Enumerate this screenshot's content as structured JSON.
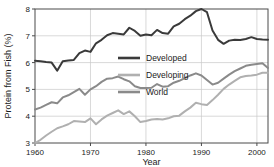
{
  "chart_data": {
    "type": "line",
    "title": "",
    "xlabel": "Year",
    "ylabel": "Protein from Fish (%)",
    "xlim": [
      1960,
      2002
    ],
    "ylim": [
      3,
      8
    ],
    "xticks": [
      1960,
      1970,
      1980,
      1990,
      2000
    ],
    "yticks": [
      3,
      4,
      5,
      6,
      7,
      8
    ],
    "grid": true,
    "legend_position": "center",
    "x": [
      1960,
      1961,
      1962,
      1963,
      1964,
      1965,
      1966,
      1967,
      1968,
      1969,
      1970,
      1971,
      1972,
      1973,
      1974,
      1975,
      1976,
      1977,
      1978,
      1979,
      1980,
      1981,
      1982,
      1983,
      1984,
      1985,
      1986,
      1987,
      1988,
      1989,
      1990,
      1991,
      1992,
      1993,
      1994,
      1995,
      1996,
      1997,
      1998,
      1999,
      2000,
      2001,
      2002
    ],
    "series": [
      {
        "name": "Developed",
        "color": "#3a3a3a",
        "values": [
          6.07,
          6.05,
          6.02,
          6.0,
          5.7,
          6.05,
          6.08,
          6.1,
          6.35,
          6.45,
          6.4,
          6.72,
          6.85,
          7.02,
          7.1,
          7.08,
          7.05,
          7.3,
          7.18,
          7.0,
          7.05,
          7.02,
          7.22,
          7.1,
          7.08,
          7.35,
          7.45,
          7.62,
          7.75,
          7.92,
          8.0,
          7.88,
          7.2,
          6.85,
          6.7,
          6.82,
          6.85,
          6.84,
          6.88,
          6.95,
          6.88,
          6.86,
          6.85
        ]
      },
      {
        "name": "Developing",
        "color": "#b0b0b0",
        "values": [
          3.0,
          3.12,
          3.28,
          3.42,
          3.55,
          3.62,
          3.7,
          3.82,
          3.8,
          3.78,
          3.92,
          3.7,
          3.88,
          4.02,
          4.12,
          4.22,
          4.08,
          4.18,
          4.0,
          3.78,
          3.82,
          3.88,
          3.9,
          3.88,
          3.92,
          4.0,
          4.02,
          4.18,
          4.32,
          4.5,
          4.45,
          4.42,
          4.6,
          4.8,
          5.02,
          5.18,
          5.32,
          5.45,
          5.5,
          5.52,
          5.55,
          5.62,
          5.62
        ]
      },
      {
        "name": "World",
        "color": "#8a8a8a",
        "values": [
          4.25,
          4.32,
          4.42,
          4.52,
          4.48,
          4.7,
          4.78,
          4.9,
          5.02,
          4.8,
          5.0,
          5.12,
          5.28,
          5.4,
          5.42,
          5.48,
          5.38,
          5.3,
          5.12,
          5.05,
          5.05,
          5.06,
          5.2,
          5.1,
          5.12,
          5.25,
          5.32,
          5.42,
          5.52,
          5.6,
          5.52,
          5.35,
          5.18,
          5.25,
          5.4,
          5.55,
          5.68,
          5.78,
          5.88,
          5.92,
          5.95,
          5.98,
          5.8
        ]
      }
    ]
  },
  "legend": {
    "items": [
      {
        "label": "Developed"
      },
      {
        "label": "Developing"
      },
      {
        "label": "World"
      }
    ]
  },
  "axes": {
    "x_title": "Year",
    "y_title": "Protein from Fish (%)",
    "x_tick_labels": [
      "1960",
      "1970",
      "1980",
      "1990",
      "2000"
    ],
    "y_tick_labels": [
      "8",
      "7",
      "6",
      "5",
      "4",
      "3"
    ]
  }
}
